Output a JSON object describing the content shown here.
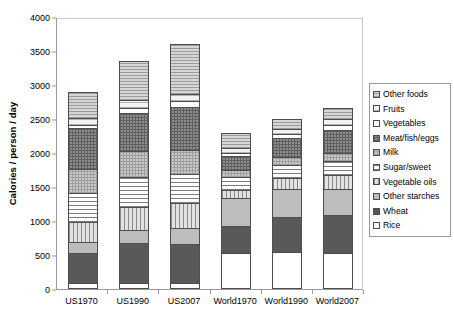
{
  "chart_data": {
    "type": "bar",
    "subtype": "stacked-bar",
    "title": "",
    "xlabel": "",
    "ylabel": "Calories / person / day",
    "ylim": [
      0,
      4000
    ],
    "ytick_values": [
      0,
      500,
      1000,
      1500,
      2000,
      2500,
      3000,
      3500,
      4000
    ],
    "ytick_labels": [
      "0",
      "500",
      "1000",
      "1500",
      "2000",
      "2500",
      "3000",
      "3500",
      "4000"
    ],
    "grid": false,
    "legend_position": "right",
    "categories": [
      "US1970",
      "US1990",
      "US2007",
      "World1970",
      "World1990",
      "World2007"
    ],
    "series": [
      {
        "name": "Rice",
        "pattern": "rice",
        "values": [
          85,
          90,
          95,
          530,
          545,
          530
        ]
      },
      {
        "name": "Wheat",
        "pattern": "wheat",
        "values": [
          455,
          595,
          585,
          405,
          530,
          570
        ]
      },
      {
        "name": "Other starches",
        "pattern": "other-starches",
        "values": [
          185,
          215,
          240,
          430,
          420,
          400
        ]
      },
      {
        "name": "Vegetable oils",
        "pattern": "vegetable-oils",
        "values": [
          300,
          350,
          390,
          140,
          185,
          215
        ]
      },
      {
        "name": "Sugar/sweet",
        "pattern": "sugar",
        "values": [
          440,
          460,
          440,
          195,
          205,
          225
        ]
      },
      {
        "name": "Milk",
        "pattern": "milk",
        "values": [
          370,
          395,
          375,
          125,
          130,
          140
        ]
      },
      {
        "name": "Meat/fish/eggs",
        "pattern": "meat",
        "values": [
          615,
          575,
          640,
          225,
          290,
          345
        ]
      },
      {
        "name": "Vegetables",
        "pattern": "vegetables",
        "values": [
          70,
          90,
          100,
          60,
          75,
          85
        ]
      },
      {
        "name": "Fruits",
        "pattern": "fruits",
        "values": [
          110,
          125,
          115,
          85,
          95,
          105
        ]
      },
      {
        "name": "Other foods",
        "pattern": "other-foods",
        "values": [
          400,
          585,
          750,
          235,
          155,
          185
        ]
      }
    ],
    "totals": [
      3030,
      3480,
      3730,
      2430,
      2630,
      2800
    ]
  },
  "legend": {
    "items": [
      {
        "label": "Other foods",
        "pattern": "other-foods"
      },
      {
        "label": "Fruits",
        "pattern": "fruits"
      },
      {
        "label": "Vegetables",
        "pattern": "vegetables"
      },
      {
        "label": "Meat/fish/eggs",
        "pattern": "meat"
      },
      {
        "label": "Milk",
        "pattern": "milk"
      },
      {
        "label": "Sugar/sweet",
        "pattern": "sugar"
      },
      {
        "label": "Vegetable oils",
        "pattern": "vegetable-oils"
      },
      {
        "label": "Other starches",
        "pattern": "other-starches"
      },
      {
        "label": "Wheat",
        "pattern": "wheat"
      },
      {
        "label": "Rice",
        "pattern": "rice"
      }
    ]
  },
  "colors": {
    "axis": "#9a9a9a",
    "segment_border": "#4d4d4d",
    "background": "#ffffff",
    "text": "#000000"
  }
}
